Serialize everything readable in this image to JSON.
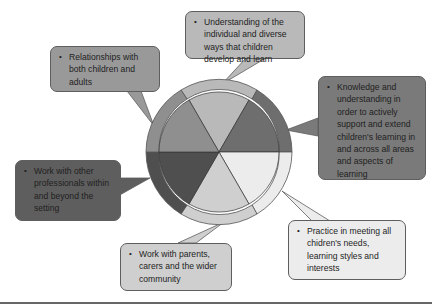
{
  "diagram": {
    "type": "wheel-with-callouts",
    "wheel": {
      "center": [
        219,
        152
      ],
      "outer_radius": 73,
      "inner_radius": 60,
      "segments": [
        {
          "name": "top",
          "color": "#b9b9b9"
        },
        {
          "name": "upper-right",
          "color": "#6e6e6e"
        },
        {
          "name": "lower-right",
          "color": "#ececec"
        },
        {
          "name": "bottom",
          "color": "#cfcfcf"
        },
        {
          "name": "lower-left",
          "color": "#4f4f4f"
        },
        {
          "name": "upper-left",
          "color": "#8f8f8f"
        }
      ]
    },
    "callouts": [
      {
        "id": "top",
        "text": "Understanding of the individual and diverse ways that children develop and learn",
        "color": "#b9b9b9"
      },
      {
        "id": "right",
        "text": "Knowledge and understanding in order to actively support and extend children's learning in and across all areas and aspects of learning",
        "color": "#7a7a7a"
      },
      {
        "id": "bottom-right",
        "text": "Practice in meeting all chidren's needs, learning styles and interests",
        "color": "#ececec"
      },
      {
        "id": "bottom",
        "text": "Work with parents, carers and the wider community",
        "color": "#cfcfcf"
      },
      {
        "id": "left",
        "text": "Work with other professionals within and beyond the setting",
        "color": "#5e5e5e"
      },
      {
        "id": "upper-left",
        "text": "Relationships with both children and adults",
        "color": "#999999"
      }
    ],
    "bullet": "•"
  }
}
